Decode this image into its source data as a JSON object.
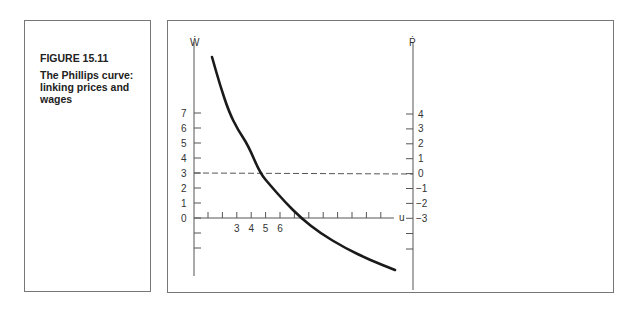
{
  "figure": {
    "number": "FIGURE 15.11",
    "title": "The Phillips curve: linking prices and wages"
  },
  "chart_data": {
    "type": "line",
    "title": "The Phillips curve: linking prices and wages",
    "left_axis": {
      "label": "Ẇ",
      "ticks": [
        "7",
        "6",
        "5",
        "4",
        "3",
        "2",
        "1",
        "0"
      ],
      "extra_unlabeled_ticks_below_zero": 2
    },
    "right_axis": {
      "label": "Ṗ",
      "ticks": [
        "4",
        "3",
        "2",
        "1",
        "0",
        "−1",
        "−2",
        "−3"
      ],
      "extra_unlabeled_ticks_below": 2
    },
    "x_axis": {
      "label": "u",
      "tick_labels": [
        "3",
        "4",
        "5",
        "6"
      ],
      "tick_count": 13
    },
    "reference_line": {
      "style": "dashed",
      "left_value": 3,
      "right_value": 0,
      "description": "Ẇ = 3 corresponds to Ṗ = 0"
    },
    "series": [
      {
        "name": "Phillips curve",
        "description": "downward-sloping convex curve; crosses dashed line near u≈5, crosses x-axis shortly after u=6",
        "points_pixel": [
          [
            212,
            57
          ],
          [
            220,
            85
          ],
          [
            229,
            112
          ],
          [
            238,
            130
          ],
          [
            248,
            145
          ],
          [
            260,
            173
          ],
          [
            270,
            185
          ],
          [
            285,
            202
          ],
          [
            301,
            218
          ],
          [
            320,
            233
          ],
          [
            345,
            248
          ],
          [
            370,
            260
          ],
          [
            395,
            270
          ]
        ]
      }
    ],
    "grid": false
  }
}
